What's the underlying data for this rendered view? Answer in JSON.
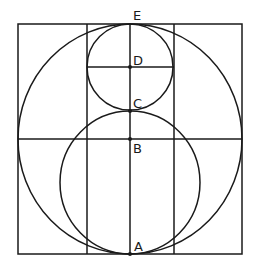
{
  "diagram": {
    "stroke_color": "#1a1a1a",
    "background": "#ffffff",
    "outer_square": {
      "x": 18,
      "y": 24,
      "width": 224,
      "height": 230
    },
    "inner_vertical_lines": [
      {
        "x": 87,
        "y1": 24,
        "y2": 254
      },
      {
        "x": 174,
        "y1": 24,
        "y2": 254
      }
    ],
    "center_vertical_line": {
      "x": 130,
      "y1": 24,
      "y2": 254
    },
    "horizontal_lines": [
      {
        "name": "through-D",
        "y": 67,
        "x1": 87,
        "x2": 174
      },
      {
        "name": "through-B",
        "y": 139,
        "x1": 18,
        "x2": 242
      }
    ],
    "circles": [
      {
        "name": "large-circle",
        "cx": 130,
        "cy": 139,
        "rx": 112,
        "ry": 115
      },
      {
        "name": "small-top-circle",
        "cx": 130,
        "cy": 67,
        "r": 43
      },
      {
        "name": "middle-circle",
        "cx": 130,
        "cy": 182.5,
        "rx": 70,
        "ry": 71.5
      }
    ],
    "points": [
      {
        "label": "E",
        "x": 130,
        "y": 24,
        "label_x": 133,
        "label_y": 20
      },
      {
        "label": "D",
        "x": 130,
        "y": 67,
        "label_x": 133,
        "label_y": 64
      },
      {
        "label": "C",
        "x": 130,
        "y": 111,
        "label_x": 133,
        "label_y": 107
      },
      {
        "label": "B",
        "x": 130,
        "y": 139,
        "label_x": 133,
        "label_y": 153
      },
      {
        "label": "A",
        "x": 130,
        "y": 254,
        "label_x": 134,
        "label_y": 250
      }
    ]
  }
}
